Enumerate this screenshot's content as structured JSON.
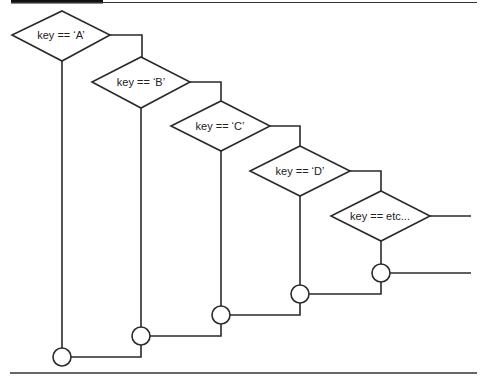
{
  "diagram": {
    "type": "flowchart",
    "colors": {
      "line": "#2a2a2a",
      "background": "#ffffff",
      "header_bar": "#111111"
    },
    "decisions": [
      {
        "id": "A",
        "label": "key == ‘A’"
      },
      {
        "id": "B",
        "label": "key == ‘B’"
      },
      {
        "id": "C",
        "label": "key == ‘C’"
      },
      {
        "id": "D",
        "label": "key == ‘D’"
      },
      {
        "id": "etc",
        "label": "key == etc..."
      }
    ],
    "junctions": [
      "A",
      "B",
      "C",
      "D",
      "etc"
    ]
  }
}
